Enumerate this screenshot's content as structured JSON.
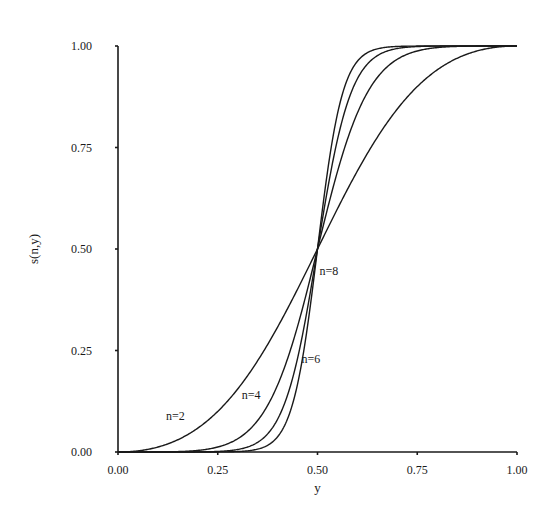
{
  "chart_data": {
    "type": "line",
    "title": "",
    "xlabel": "y",
    "ylabel": "s(n,y)",
    "xlim": [
      0,
      1
    ],
    "ylim": [
      0,
      1
    ],
    "grid": false,
    "legend": "none",
    "x_ticks": [
      "0.00",
      "0.25",
      "0.50",
      "0.75",
      "1.00"
    ],
    "y_ticks": [
      "0.00",
      "0.25",
      "0.50",
      "0.75",
      "1.00"
    ],
    "function": "s(n,y) = y^n / (y^n + (1-y)^n)",
    "series": [
      {
        "name": "n=2",
        "n": 2,
        "x": [
          0,
          0.1,
          0.2,
          0.25,
          0.3,
          0.4,
          0.5,
          0.6,
          0.7,
          0.75,
          0.8,
          0.9,
          1
        ],
        "values": [
          0,
          0.012,
          0.059,
          0.1,
          0.155,
          0.308,
          0.5,
          0.692,
          0.845,
          0.9,
          0.941,
          0.988,
          1
        ]
      },
      {
        "name": "n=4",
        "n": 4,
        "x": [
          0,
          0.1,
          0.2,
          0.25,
          0.3,
          0.4,
          0.5,
          0.6,
          0.7,
          0.75,
          0.8,
          0.9,
          1
        ],
        "values": [
          0,
          0.0002,
          0.004,
          0.012,
          0.033,
          0.165,
          0.5,
          0.835,
          0.967,
          0.988,
          0.996,
          0.9998,
          1
        ]
      },
      {
        "name": "n=6",
        "n": 6,
        "x": [
          0,
          0.1,
          0.2,
          0.25,
          0.3,
          0.4,
          0.5,
          0.6,
          0.7,
          0.75,
          0.8,
          0.9,
          1
        ],
        "values": [
          0,
          0.0,
          0.0002,
          0.001,
          0.006,
          0.081,
          0.5,
          0.919,
          0.994,
          0.999,
          0.9998,
          1.0,
          1
        ]
      },
      {
        "name": "n=8",
        "n": 8,
        "x": [
          0,
          0.1,
          0.2,
          0.25,
          0.3,
          0.4,
          0.5,
          0.6,
          0.7,
          0.75,
          0.8,
          0.9,
          1
        ],
        "values": [
          0,
          0.0,
          0.0,
          0.0002,
          0.001,
          0.038,
          0.5,
          0.962,
          0.999,
          0.9998,
          1.0,
          1.0,
          1
        ]
      }
    ],
    "annotations": [
      {
        "text": "n=2",
        "x": 0.12,
        "y": 0.08
      },
      {
        "text": "n=4",
        "x": 0.31,
        "y": 0.13
      },
      {
        "text": "n=6",
        "x": 0.46,
        "y": 0.22
      },
      {
        "text": "n=8",
        "x": 0.505,
        "y": 0.435
      }
    ]
  }
}
